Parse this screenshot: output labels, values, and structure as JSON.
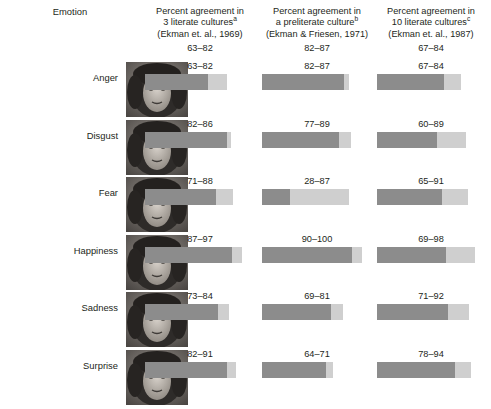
{
  "header": {
    "emotion_label": "Emotion",
    "columns": [
      {
        "line1": "Percent agreement in",
        "line2": "3 literate cultures",
        "sup": "a",
        "line3": "(Ekman et. al., 1969)"
      },
      {
        "line1": "Percent agreement in",
        "line2": "a preliterate culture",
        "sup": "b",
        "line3": "(Ekman & Friesen, 1971)"
      },
      {
        "line1": "Percent agreement in",
        "line2": "10 literate cultures",
        "sup": "c",
        "line3": "(Ekman et. al., 1987)"
      }
    ]
  },
  "chart_data": {
    "type": "bar",
    "xlabel": "",
    "ylabel": "Emotion",
    "xlim": [
      0,
      100
    ],
    "grid": false,
    "legend": "none",
    "note": "Each bar is a range: dark segment spans 0 to the low value, light segment spans low to high value.",
    "categories": [
      "Anger",
      "Disgust",
      "Fear",
      "Happiness",
      "Sadness",
      "Surprise"
    ],
    "series": [
      {
        "name": "3 literate cultures (Ekman et. al., 1969)",
        "low": [
          63,
          82,
          71,
          87,
          73,
          82
        ],
        "high": [
          82,
          86,
          88,
          97,
          84,
          91
        ],
        "labels": [
          "63–82",
          "82–86",
          "71–88",
          "87–97",
          "73–84",
          "82–91"
        ]
      },
      {
        "name": "a preliterate culture (Ekman & Friesen, 1971)",
        "low": [
          82,
          77,
          28,
          90,
          69,
          64
        ],
        "high": [
          87,
          89,
          87,
          100,
          81,
          71
        ],
        "labels": [
          "82–87",
          "77–89",
          "28–87",
          "90–100",
          "69–81",
          "64–71"
        ]
      },
      {
        "name": "10 literate cultures (Ekman et. al., 1987)",
        "low": [
          67,
          60,
          65,
          69,
          71,
          78
        ],
        "high": [
          84,
          89,
          91,
          98,
          92,
          94
        ],
        "labels": [
          "67–84",
          "60–89",
          "65–91",
          "69–98",
          "71–92",
          "78–94"
        ]
      }
    ],
    "colors": {
      "low_segment": "#8c8c8c",
      "high_segment": "#cfcfcf",
      "text": "#231f20",
      "background": "#ffffff"
    }
  },
  "rows": [
    {
      "emotion": "Anger",
      "face": "face-anger-photo"
    },
    {
      "emotion": "Disgust",
      "face": "face-disgust-photo"
    },
    {
      "emotion": "Fear",
      "face": "face-fear-photo"
    },
    {
      "emotion": "Happiness",
      "face": "face-happiness-photo"
    },
    {
      "emotion": "Sadness",
      "face": "face-sadness-photo"
    },
    {
      "emotion": "Surprise",
      "face": "face-surprise-photo"
    }
  ]
}
